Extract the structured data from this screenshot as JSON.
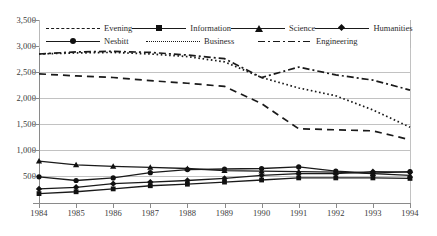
{
  "chart_data": {
    "type": "line",
    "title": "",
    "xlabel": "",
    "ylabel": "",
    "grid": "horizontal",
    "legend_position": "top-inside",
    "x": [
      1984,
      1985,
      1986,
      1987,
      1988,
      1989,
      1990,
      1991,
      1992,
      1993,
      1994
    ],
    "categories": [
      "1984",
      "1985",
      "1986",
      "1987",
      "1988",
      "1989",
      "1990",
      "1991",
      "1992",
      "1993",
      "1994"
    ],
    "ylim": [
      0,
      3500
    ],
    "yticks": [
      0,
      500,
      1000,
      1500,
      2000,
      2500,
      3000,
      3500
    ],
    "ytick_labels": [
      "",
      "500",
      "1,000",
      "1,500",
      "2,000",
      "2,500",
      "3,000",
      "3,500"
    ],
    "series": [
      {
        "name": "Evening",
        "style": "dashed",
        "marker": "none",
        "values": [
          2470,
          2430,
          2400,
          2340,
          2290,
          2230,
          1900,
          1420,
          1400,
          1380,
          1210
        ]
      },
      {
        "name": "Information",
        "style": "solid",
        "marker": "square",
        "values": [
          180,
          215,
          270,
          330,
          360,
          400,
          440,
          480,
          480,
          480,
          470
        ]
      },
      {
        "name": "Science",
        "style": "solid",
        "marker": "triangle",
        "values": [
          800,
          730,
          700,
          680,
          660,
          620,
          610,
          600,
          590,
          560,
          530
        ]
      },
      {
        "name": "Humanities",
        "style": "solid",
        "marker": "diamond",
        "values": [
          270,
          300,
          370,
          400,
          430,
          470,
          530,
          560,
          560,
          600,
          590
        ]
      },
      {
        "name": "Nesbitt",
        "style": "solid",
        "marker": "circle",
        "values": [
          500,
          430,
          480,
          580,
          640,
          650,
          660,
          690,
          610,
          570,
          600
        ]
      },
      {
        "name": "Business",
        "style": "dotted",
        "marker": "none",
        "values": [
          2850,
          2870,
          2880,
          2850,
          2800,
          2700,
          2400,
          2200,
          2050,
          1780,
          1450
        ]
      },
      {
        "name": "Engineering",
        "style": "dash-dot",
        "marker": "none",
        "values": [
          2850,
          2890,
          2900,
          2880,
          2830,
          2760,
          2400,
          2600,
          2450,
          2350,
          2160
        ]
      }
    ],
    "colors": {
      "line": "#1a1a1a",
      "grid": "#c2c2c2",
      "axis": "#8a8a8a",
      "text": "#2b2b2b",
      "background": "#ffffff"
    }
  },
  "legend": {
    "row1": [
      {
        "label": "Evening",
        "symbol": "dashed-line"
      },
      {
        "label": "Information",
        "symbol": "solid-line-square-marker"
      },
      {
        "label": "Science",
        "symbol": "solid-line-triangle-marker"
      },
      {
        "label": "Humanities",
        "symbol": "solid-line-diamond-marker"
      }
    ],
    "row2": [
      {
        "label": "Nesbitt",
        "symbol": "solid-line-circle-marker"
      },
      {
        "label": "Business",
        "symbol": "dotted-line"
      },
      {
        "label": "Engineering",
        "symbol": "dash-dot-line"
      }
    ]
  }
}
